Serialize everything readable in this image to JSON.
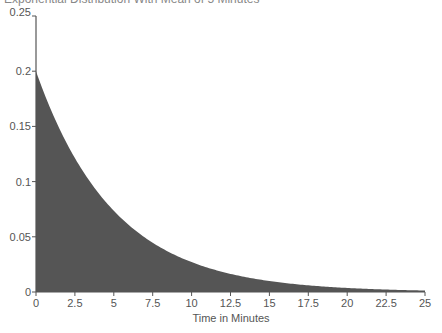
{
  "chart_data": {
    "type": "area",
    "title": "Exponential Distribution With Mean of 5 Minutes",
    "title_clipped": true,
    "xlabel": "Time in Minutes",
    "ylabel": "",
    "xlim": [
      0,
      25
    ],
    "ylim": [
      0,
      0.25
    ],
    "x_ticks": [
      0,
      2.5,
      5,
      7.5,
      10,
      12.5,
      15,
      17.5,
      20,
      22.5,
      25
    ],
    "x_tick_labels": [
      "0",
      "2.5",
      "5",
      "7.5",
      "10",
      "12.5",
      "15",
      "17.5",
      "20",
      "22.5",
      "25"
    ],
    "y_ticks": [
      0,
      0.05,
      0.1,
      0.15,
      0.2,
      0.25
    ],
    "y_tick_labels": [
      "0",
      "0.05",
      "0.1",
      "0.15",
      "0.2",
      "0.25"
    ],
    "grid": false,
    "legend": null,
    "function": "f(x) = 0.2 * exp(-0.2 x)",
    "rate": 0.2,
    "mean": 5,
    "x": [
      0,
      2.5,
      5,
      7.5,
      10,
      12.5,
      15,
      17.5,
      20,
      22.5,
      25
    ],
    "values": [
      0.2,
      0.1213,
      0.0736,
      0.0446,
      0.0271,
      0.0164,
      0.01,
      0.006,
      0.0037,
      0.0022,
      0.0013
    ],
    "fill_color": "#555555",
    "axis_color": "#555555"
  }
}
